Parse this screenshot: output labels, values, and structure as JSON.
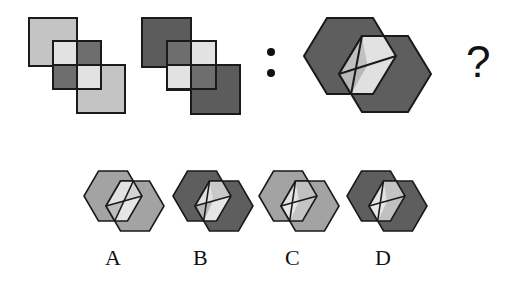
{
  "puzzle": {
    "separator": ":",
    "question_mark": "?",
    "stroke_color": "#1a1a1a",
    "figure1": {
      "squares": [
        {
          "x": 29,
          "y": 18,
          "size": 48,
          "fill": "#c4c4c4"
        },
        {
          "x": 53,
          "y": 41,
          "size": 48,
          "fill": "none"
        },
        {
          "x": 77,
          "y": 65,
          "size": 48,
          "fill": "#c4c4c4"
        }
      ],
      "cells": [
        {
          "x": 53,
          "y": 41,
          "w": 24,
          "h": 24,
          "fill": "#e2e2e2"
        },
        {
          "x": 77,
          "y": 41,
          "w": 24,
          "h": 24,
          "fill": "#6e6e6e"
        },
        {
          "x": 53,
          "y": 65,
          "w": 24,
          "h": 24,
          "fill": "#6e6e6e"
        },
        {
          "x": 77,
          "y": 65,
          "w": 24,
          "h": 24,
          "fill": "#e2e2e2"
        }
      ]
    },
    "figure2": {
      "squares": [
        {
          "x": 142,
          "y": 18,
          "size": 49,
          "fill": "#5c5c5c"
        },
        {
          "x": 167,
          "y": 41,
          "size": 49,
          "fill": "none"
        },
        {
          "x": 191,
          "y": 65,
          "size": 49,
          "fill": "#5c5c5c"
        }
      ],
      "cells": [
        {
          "x": 167,
          "y": 41,
          "w": 24,
          "h": 24,
          "fill": "#6e6e6e"
        },
        {
          "x": 191,
          "y": 41,
          "w": 25,
          "h": 24,
          "fill": "#e2e2e2"
        },
        {
          "x": 167,
          "y": 65,
          "w": 24,
          "h": 24,
          "fill": "#e2e2e2"
        },
        {
          "x": 191,
          "y": 65,
          "w": 25,
          "h": 24,
          "fill": "#6e6e6e"
        }
      ]
    },
    "figure3": {
      "hex_fill": "#5e5e5e",
      "hex1": {
        "cx": 350,
        "cy": 56,
        "rx": 46,
        "ry": 38
      },
      "hex2": {
        "cx": 385,
        "cy": 74,
        "rx": 46,
        "ry": 38
      },
      "overlap_colors": {
        "top": "#c0c0c0",
        "right": "#e2e2e2",
        "bottom": "#e0e0e0",
        "left": "#b8b8b8"
      }
    },
    "options": [
      {
        "label": "A",
        "cx": 113,
        "hex_fill": "#a3a3a3",
        "overlap_colors": {
          "top": "#e2e2e2",
          "right": "#d4d4d4",
          "bottom": "#e6e6e6",
          "left": "#bdbdbd"
        }
      },
      {
        "label": "B",
        "cx": 202,
        "hex_fill": "#5e5e5e",
        "overlap_colors": {
          "top": "#e2e2e2",
          "right": "#c8c8c8",
          "bottom": "#e6e6e6",
          "left": "#b8b8b8"
        }
      },
      {
        "label": "C",
        "cx": 288,
        "hex_fill": "#a3a3a3",
        "overlap_colors": {
          "top": "#e2e2e2",
          "right": "#c0c0c0",
          "bottom": "#c4c4c4",
          "left": "#e6e6e6"
        }
      },
      {
        "label": "D",
        "cx": 376,
        "hex_fill": "#5e5e5e",
        "overlap_colors": {
          "top": "#e2e2e2",
          "right": "#c4c4c4",
          "bottom": "#c0c0c0",
          "left": "#e6e6e6"
        }
      }
    ],
    "option_geometry": {
      "cy": 196,
      "rx": 29,
      "ry": 25,
      "dx": 22,
      "dy": 10
    },
    "label_y": 247
  }
}
